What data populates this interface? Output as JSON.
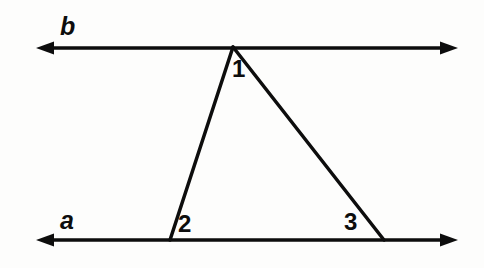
{
  "figure": {
    "background_color": "#fdfdfc",
    "stroke_color": "#0d0d0d",
    "width": 484,
    "height": 268
  },
  "lines": [
    {
      "id": "line-b",
      "label": "b",
      "orientation": "horizontal",
      "y": 48,
      "x_start": 36,
      "x_end": 458,
      "arrowheads": "both",
      "stroke_width": 3.5
    },
    {
      "id": "line-a",
      "label": "a",
      "orientation": "horizontal",
      "y": 240,
      "x_start": 36,
      "x_end": 458,
      "arrowheads": "both",
      "stroke_width": 3.5
    }
  ],
  "triangle": {
    "vertices": {
      "apex": {
        "x": 233,
        "y": 47
      },
      "bottom_left": {
        "x": 170,
        "y": 240
      },
      "bottom_right": {
        "x": 384,
        "y": 240
      }
    },
    "stroke_width": 3.5,
    "fill": "none"
  },
  "angle_labels": [
    {
      "id": "angle-1",
      "text": "1",
      "x": 232,
      "y": 57,
      "vertex": "apex"
    },
    {
      "id": "angle-2",
      "text": "2",
      "x": 178,
      "y": 212,
      "vertex": "bottom_left"
    },
    {
      "id": "angle-3",
      "text": "3",
      "x": 344,
      "y": 210,
      "vertex": "bottom_right"
    }
  ],
  "icons": {
    "arrow_left": "arrow-left-icon",
    "arrow_right": "arrow-right-icon"
  }
}
